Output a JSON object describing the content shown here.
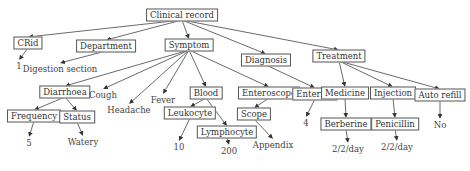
{
  "diagram": {
    "title": "Clinical record",
    "nodes": [
      {
        "id": "root",
        "label": "Clinical record",
        "x": 182,
        "y": 15,
        "boxed": true
      },
      {
        "id": "crid",
        "label": "CRid",
        "x": 28,
        "y": 43,
        "boxed": true
      },
      {
        "id": "one",
        "label": "1",
        "x": 19,
        "y": 66,
        "boxed": false
      },
      {
        "id": "dept",
        "label": "Department",
        "x": 106,
        "y": 46,
        "boxed": true
      },
      {
        "id": "digest",
        "label": "Digestion section",
        "x": 60,
        "y": 69,
        "boxed": false
      },
      {
        "id": "symptom",
        "label": "Symptom",
        "x": 189,
        "y": 45,
        "boxed": true
      },
      {
        "id": "diagnosis",
        "label": "Diagnosis",
        "x": 266,
        "y": 60,
        "boxed": true
      },
      {
        "id": "treatment",
        "label": "Treatment",
        "x": 339,
        "y": 56,
        "boxed": true
      },
      {
        "id": "diarrhoea",
        "label": "Diarrhoea",
        "x": 65,
        "y": 92,
        "boxed": true
      },
      {
        "id": "cough",
        "label": "Cough",
        "x": 103,
        "y": 95,
        "boxed": false
      },
      {
        "id": "headache",
        "label": "Headache",
        "x": 129,
        "y": 110,
        "boxed": false
      },
      {
        "id": "fever",
        "label": "Fever",
        "x": 163,
        "y": 100,
        "boxed": false
      },
      {
        "id": "blood",
        "label": "Blood",
        "x": 206,
        "y": 93,
        "boxed": true
      },
      {
        "id": "enteroscope",
        "label": "Enteroscope",
        "x": 269,
        "y": 93,
        "boxed": true
      },
      {
        "id": "enteritis",
        "label": "Enteritis",
        "x": 315,
        "y": 94,
        "boxed": true
      },
      {
        "id": "medicine",
        "label": "Medicine",
        "x": 345,
        "y": 93,
        "boxed": true
      },
      {
        "id": "injection",
        "label": "Injection",
        "x": 393,
        "y": 93,
        "boxed": true
      },
      {
        "id": "autorefill",
        "label": "Auto refill",
        "x": 440,
        "y": 95,
        "boxed": true
      },
      {
        "id": "frequency",
        "label": "Frequency",
        "x": 34,
        "y": 116,
        "boxed": true
      },
      {
        "id": "status",
        "label": "Status",
        "x": 77,
        "y": 117,
        "boxed": true
      },
      {
        "id": "leukocyte",
        "label": "Leukocyte",
        "x": 190,
        "y": 113,
        "boxed": true
      },
      {
        "id": "lymphocyte",
        "label": "Lymphocyte",
        "x": 227,
        "y": 132,
        "boxed": true
      },
      {
        "id": "scope",
        "label": "Scope",
        "x": 254,
        "y": 114,
        "boxed": true
      },
      {
        "id": "four",
        "label": "4",
        "x": 306,
        "y": 123,
        "boxed": false
      },
      {
        "id": "berberine",
        "label": "Berberine",
        "x": 346,
        "y": 124,
        "boxed": true
      },
      {
        "id": "penicillin",
        "label": "Penicillin",
        "x": 395,
        "y": 124,
        "boxed": true
      },
      {
        "id": "no",
        "label": "No",
        "x": 440,
        "y": 125,
        "boxed": false
      },
      {
        "id": "five",
        "label": "5",
        "x": 29,
        "y": 143,
        "boxed": false
      },
      {
        "id": "watery",
        "label": "Watery",
        "x": 83,
        "y": 142,
        "boxed": false
      },
      {
        "id": "ten",
        "label": "10",
        "x": 179,
        "y": 147,
        "boxed": false
      },
      {
        "id": "twohundred",
        "label": "200",
        "x": 229,
        "y": 151,
        "boxed": false
      },
      {
        "id": "appendix",
        "label": "Appendix",
        "x": 273,
        "y": 145,
        "boxed": false
      },
      {
        "id": "dose1",
        "label": "2/2/day",
        "x": 348,
        "y": 149,
        "boxed": false
      },
      {
        "id": "dose2",
        "label": "2/2/day",
        "x": 397,
        "y": 147,
        "boxed": false
      }
    ],
    "edges": [
      [
        "root",
        "crid"
      ],
      [
        "root",
        "dept"
      ],
      [
        "root",
        "symptom"
      ],
      [
        "root",
        "diagnosis"
      ],
      [
        "root",
        "treatment"
      ],
      [
        "crid",
        "one"
      ],
      [
        "dept",
        "digest"
      ],
      [
        "symptom",
        "diarrhoea"
      ],
      [
        "symptom",
        "cough"
      ],
      [
        "symptom",
        "headache"
      ],
      [
        "symptom",
        "fever"
      ],
      [
        "symptom",
        "blood"
      ],
      [
        "symptom",
        "enteroscope"
      ],
      [
        "diagnosis",
        "enteritis"
      ],
      [
        "treatment",
        "medicine"
      ],
      [
        "treatment",
        "injection"
      ],
      [
        "treatment",
        "autorefill"
      ],
      [
        "diarrhoea",
        "frequency"
      ],
      [
        "diarrhoea",
        "status"
      ],
      [
        "frequency",
        "five"
      ],
      [
        "status",
        "watery"
      ],
      [
        "blood",
        "leukocyte"
      ],
      [
        "blood",
        "lymphocyte"
      ],
      [
        "leukocyte",
        "ten"
      ],
      [
        "lymphocyte",
        "twohundred"
      ],
      [
        "enteroscope",
        "scope"
      ],
      [
        "scope",
        "appendix"
      ],
      [
        "enteritis",
        "four"
      ],
      [
        "medicine",
        "berberine"
      ],
      [
        "berberine",
        "dose1"
      ],
      [
        "injection",
        "penicillin"
      ],
      [
        "penicillin",
        "dose2"
      ],
      [
        "autorefill",
        "no"
      ]
    ]
  }
}
